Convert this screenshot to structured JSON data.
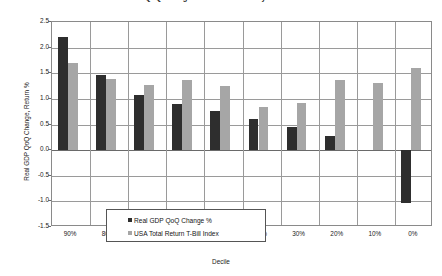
{
  "chart_data": {
    "type": "bar",
    "title": "Real GDP QoQ Change and Total Return by T-Bill Index Decile",
    "xlabel": "Decile",
    "ylabel": "Real GDP QoQ Change, Return %",
    "categories": [
      "90%",
      "80%",
      "70%",
      "60%",
      "50%",
      "40%",
      "30%",
      "20%",
      "10%",
      "0%"
    ],
    "series": [
      {
        "name": "Real GDP QoQ Change %",
        "color": "#2e2e2e",
        "values": [
          2.2,
          1.46,
          1.08,
          0.9,
          0.77,
          0.61,
          0.45,
          0.27,
          0.0,
          -1.04
        ]
      },
      {
        "name": "USA Total Return T-Bill Index",
        "color": "#a6a6a6",
        "values": [
          1.7,
          1.38,
          1.27,
          1.37,
          1.26,
          0.84,
          0.92,
          1.37,
          1.31,
          1.6
        ]
      }
    ],
    "ylim": [
      -1.5,
      2.5
    ],
    "ystep": 0.5,
    "yticks": [
      "2.5",
      "2.0",
      "1.5",
      "1.0",
      "0.5",
      "0.0",
      "-0.5",
      "-1.0",
      "-1.5"
    ],
    "ytick_values": [
      2.5,
      2.0,
      1.5,
      1.0,
      0.5,
      0.0,
      -0.5,
      -1.0,
      -1.5
    ],
    "grid": true,
    "legend_position": "inside-lower-left",
    "plot_background": "#ffffff",
    "grid_color": "#9a9a9a",
    "axis_color": "#8a8a8a"
  }
}
